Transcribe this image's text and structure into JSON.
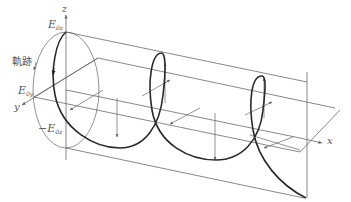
{
  "figure": {
    "title": "",
    "colors": {
      "helix": "#2a2a2a",
      "guides": "#555555",
      "axes": "#666666",
      "text": "#555555"
    }
  },
  "labels": {
    "z_axis": "z",
    "y_axis": "y",
    "x_axis": "x",
    "trajectory": "軌跡",
    "e0z_top": "E",
    "e0z_top_sub": "0z",
    "e0y": "E",
    "e0y_sub": "0y",
    "e0z_bottom_sign": "−",
    "e0z_bottom": "E",
    "e0z_bottom_sub": "0z"
  }
}
